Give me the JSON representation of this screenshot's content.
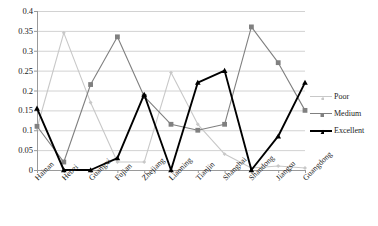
{
  "chart_data": {
    "type": "line",
    "title": "",
    "xlabel": "",
    "ylabel": "",
    "grid": true,
    "legend_position": "right",
    "ylim": [
      0,
      0.4
    ],
    "yticks": [
      "0",
      "0.05",
      "0.1",
      "0.15",
      "0.2",
      "0.25",
      "0.3",
      "0.35",
      "0.4"
    ],
    "ytick_values": [
      0,
      0.05,
      0.1,
      0.15,
      0.2,
      0.25,
      0.3,
      0.35,
      0.4
    ],
    "categories": [
      "Hainan",
      "Hebei",
      "Guangxi",
      "Fujian",
      "Zhejiang",
      "Liaoning",
      "Tianjin",
      "Shanghai",
      "Shandong",
      "Jiangsu",
      "Guangdong"
    ],
    "series": [
      {
        "name": "Poor",
        "color": "#c8c8c8",
        "marker": "diamond",
        "values": [
          0.105,
          0.345,
          0.17,
          0.02,
          0.02,
          0.245,
          0.115,
          0.04,
          0.005,
          0.01,
          0.005
        ]
      },
      {
        "name": "Medium",
        "color": "#808080",
        "marker": "square",
        "values": [
          0.11,
          0.02,
          0.215,
          0.335,
          0.185,
          0.115,
          0.1,
          0.115,
          0.36,
          0.27,
          0.15
        ]
      },
      {
        "name": "Excellent",
        "color": "#000000",
        "marker": "triangle",
        "values": [
          0.155,
          0.0,
          0.0,
          0.03,
          0.19,
          0.0,
          0.22,
          0.25,
          0.0,
          0.085,
          0.22
        ]
      }
    ]
  },
  "legend": {
    "entries": [
      {
        "label": "Poor"
      },
      {
        "label": "Medium"
      },
      {
        "label": "Excellent"
      }
    ]
  }
}
